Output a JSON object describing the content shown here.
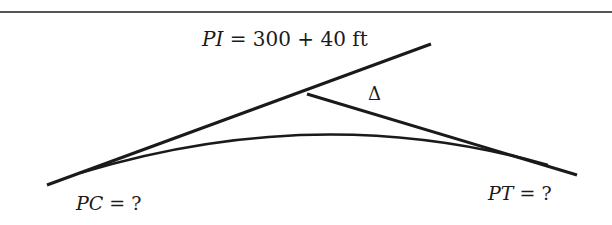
{
  "diagram": {
    "type": "horizontal-curve",
    "labels": {
      "pi": {
        "var": "PI",
        "rest": " = 300 + 40 ft"
      },
      "pc": {
        "var": "PC",
        "rest": " = ?"
      },
      "pt": {
        "var": "PT",
        "rest": " = ?"
      },
      "delta": "Δ"
    },
    "colors": {
      "line": "#1a1a1a",
      "rule": "#555555"
    }
  }
}
